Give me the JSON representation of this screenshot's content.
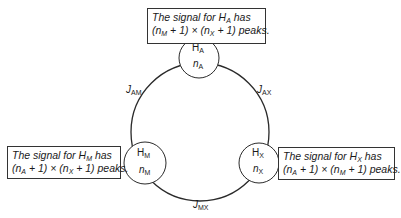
{
  "nuclei": [
    {
      "id": "A",
      "symbol": "H",
      "subscript": "A",
      "count_var": "n",
      "count_sub": "A"
    },
    {
      "id": "M",
      "symbol": "H",
      "subscript": "M",
      "count_var": "n",
      "count_sub": "M"
    },
    {
      "id": "X",
      "symbol": "H",
      "subscript": "X",
      "count_var": "n",
      "count_sub": "X"
    }
  ],
  "couplings": [
    {
      "id": "AM",
      "var": "J",
      "sub": "AM"
    },
    {
      "id": "AX",
      "var": "J",
      "sub": "AX"
    },
    {
      "id": "MX",
      "var": "J",
      "sub": "MX"
    }
  ],
  "boxes": {
    "A": {
      "line1_prefix": "The signal for H",
      "line1_sub": "A",
      "line1_suffix": " has",
      "t1": "(n",
      "s1": "M",
      "t2": " + 1) × (n",
      "s2": "X",
      "t3": " + 1) peaks."
    },
    "M": {
      "line1_prefix": "The signal for H",
      "line1_sub": "M",
      "line1_suffix": " has",
      "t1": "(n",
      "s1": "A",
      "t2": " + 1) × (n",
      "s2": "X",
      "t3": " + 1) peaks."
    },
    "X": {
      "line1_prefix": "The signal for H",
      "line1_sub": "X",
      "line1_suffix": " has",
      "t1": "(n",
      "s1": "A",
      "t2": " + 1) × (n",
      "s2": "M",
      "t3": " + 1) peaks."
    }
  },
  "colors": {
    "line": "#2a2a2a",
    "text": "#1a1a1a",
    "background": "#ffffff"
  }
}
